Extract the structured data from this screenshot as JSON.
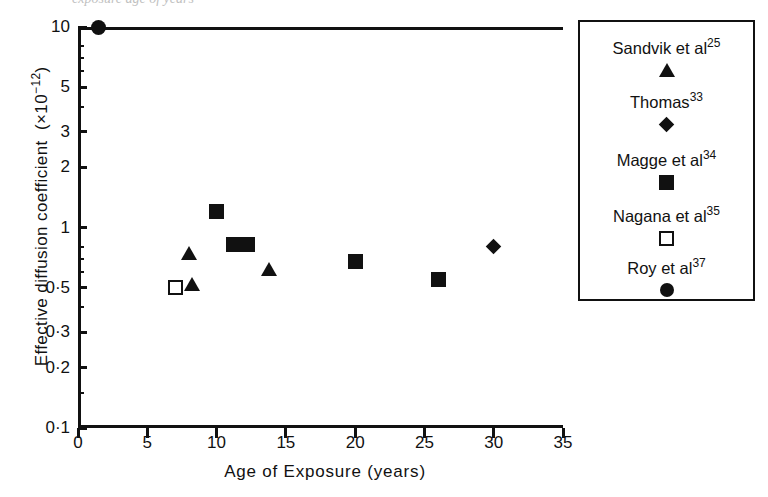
{
  "caption_fragment": "exposure age of years",
  "chart_data": {
    "type": "scatter",
    "title": "",
    "xlabel": "Age of Exposure (years)",
    "ylabel": "Effective diffusion coefficient (×10⁻¹²)",
    "xlim": [
      0,
      35
    ],
    "ylim": [
      0.1,
      10
    ],
    "yscale": "log",
    "grid": false,
    "legend_position": "right-outside",
    "xticks": [
      "0",
      "5",
      "10",
      "15",
      "20",
      "25",
      "30",
      "35"
    ],
    "xtick_values": [
      0,
      5,
      10,
      15,
      20,
      25,
      30,
      35
    ],
    "yticks": [
      "10",
      "5",
      "3",
      "2",
      "1",
      "0·5",
      "0·3",
      "0·2",
      "0·1"
    ],
    "ytick_values": [
      10,
      5,
      3,
      2,
      1,
      0.5,
      0.3,
      0.2,
      0.1
    ],
    "series": [
      {
        "name": "Sandvik et al",
        "reference": "25",
        "marker": "triangle",
        "points": [
          {
            "x": 8.0,
            "y": 0.75
          },
          {
            "x": 8.2,
            "y": 0.52
          },
          {
            "x": 13.8,
            "y": 0.62
          }
        ]
      },
      {
        "name": "Thomas",
        "reference": "33",
        "marker": "diamond",
        "points": [
          {
            "x": 30.0,
            "y": 0.8
          }
        ]
      },
      {
        "name": "Magge et al",
        "reference": "34",
        "marker": "square",
        "points": [
          {
            "x": 10.0,
            "y": 1.2
          },
          {
            "x": 11.2,
            "y": 0.82
          },
          {
            "x": 12.2,
            "y": 0.82
          },
          {
            "x": 20.0,
            "y": 0.68
          },
          {
            "x": 26.0,
            "y": 0.55
          }
        ]
      },
      {
        "name": "Nagana et al",
        "reference": "35",
        "marker": "square-open",
        "points": [
          {
            "x": 7.0,
            "y": 0.5
          }
        ]
      },
      {
        "name": "Roy et al",
        "reference": "37",
        "marker": "circle",
        "points": [
          {
            "x": 1.5,
            "y": 10.0
          }
        ]
      }
    ]
  },
  "legend": {
    "entries": [
      {
        "label": "Sandvik et al",
        "sup": "25",
        "icon": "triangle-marker-icon"
      },
      {
        "label": "Thomas",
        "sup": "33",
        "icon": "diamond-marker-icon"
      },
      {
        "label": "Magge et al",
        "sup": "34",
        "icon": "filled-square-marker-icon"
      },
      {
        "label": "Nagana et al",
        "sup": "35",
        "icon": "open-square-marker-icon"
      },
      {
        "label": "Roy et al",
        "sup": "37",
        "icon": "filled-circle-marker-icon"
      }
    ]
  },
  "colors": {
    "ink": "#111111",
    "background": "#ffffff"
  }
}
